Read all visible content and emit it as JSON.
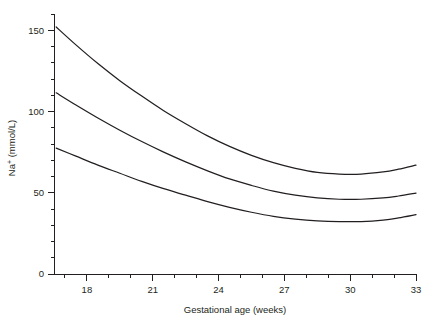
{
  "chart_data": {
    "type": "line",
    "title": "",
    "xlabel": "Gestational age (weeks)",
    "ylabel": "Na+ (mmol/L)",
    "ylabel_base": "Na",
    "ylabel_sup": "+",
    "ylabel_rest": " (mmol/L)",
    "xlim": [
      16.5,
      33
    ],
    "ylim": [
      0,
      160
    ],
    "grid": false,
    "legend": "none",
    "x_ticks_major": [
      18,
      21,
      24,
      27,
      30,
      33
    ],
    "x_ticks_major_labels": [
      "18",
      "21",
      "24",
      "27",
      "30",
      "33"
    ],
    "x_ticks_minor": [
      17,
      19,
      20,
      22,
      23,
      25,
      26,
      28,
      29,
      31,
      32
    ],
    "y_ticks_major": [
      0,
      50,
      100,
      150
    ],
    "y_ticks_major_labels": [
      "0",
      "50",
      "100",
      "150"
    ],
    "y_ticks_minor": [
      10,
      20,
      30,
      40,
      60,
      70,
      80,
      90,
      110,
      120,
      130,
      140,
      160
    ],
    "x": [
      16.6,
      17.5,
      18.5,
      19.5,
      20.5,
      21.5,
      22.5,
      23.5,
      24.5,
      25.5,
      26.5,
      27.5,
      28.5,
      29.5,
      30.5,
      31.5,
      32.2,
      33.0
    ],
    "series": [
      {
        "name": "upper",
        "values": [
          152.0,
          141.0,
          129.5,
          119.0,
          109.5,
          100.5,
          92.5,
          85.0,
          78.5,
          73.0,
          68.5,
          65.0,
          62.5,
          61.5,
          61.5,
          62.8,
          64.5,
          67.0
        ]
      },
      {
        "name": "median",
        "values": [
          111.5,
          104.0,
          96.0,
          88.5,
          81.5,
          75.0,
          69.0,
          63.5,
          58.5,
          54.5,
          51.0,
          48.5,
          46.8,
          46.0,
          46.0,
          46.8,
          48.0,
          49.8
        ]
      },
      {
        "name": "lower",
        "values": [
          77.5,
          72.5,
          67.0,
          62.0,
          57.0,
          52.5,
          48.5,
          44.5,
          41.0,
          38.0,
          35.5,
          33.8,
          32.7,
          32.2,
          32.3,
          33.2,
          34.5,
          36.5
        ]
      }
    ],
    "colors": {
      "curve": "#231f20",
      "axis": "#231f20",
      "background": "#ffffff"
    }
  }
}
